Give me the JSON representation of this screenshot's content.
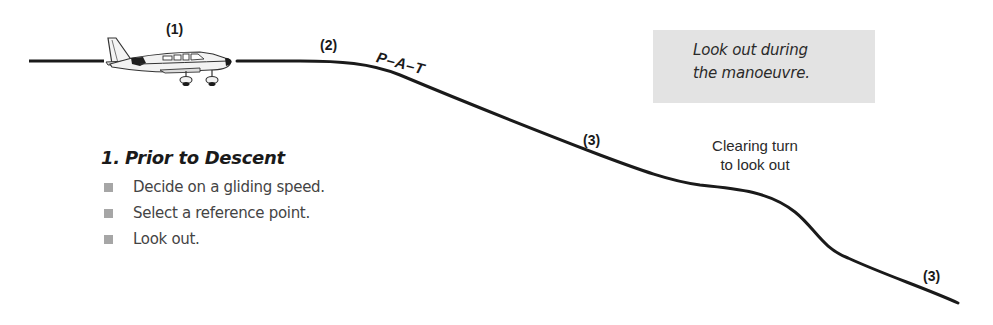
{
  "diagram": {
    "line_color": "#1a1a1a",
    "stages": [
      {
        "id": "level",
        "label": "(1)"
      },
      {
        "id": "pat",
        "label": "(2)"
      },
      {
        "id": "descent",
        "label": "(3)"
      },
      {
        "id": "final",
        "label": "(3)"
      }
    ],
    "pat_label": "P–A–T",
    "clearing_turn": {
      "line1": "Clearing turn",
      "line2": "to look out"
    },
    "note": {
      "line1": "Look out during",
      "line2": "the manoeuvre.",
      "background": "#e3e3e3"
    }
  },
  "section": {
    "number": "1.",
    "title": "Prior to Descent",
    "bullet_color": "#a6a6a6",
    "items": [
      {
        "text": "Decide on a gliding speed."
      },
      {
        "text": "Select a reference point."
      },
      {
        "text": "Look out."
      }
    ]
  }
}
